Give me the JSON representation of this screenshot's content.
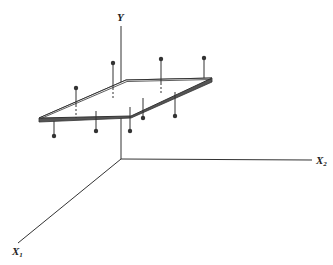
{
  "figure": {
    "axes": {
      "y_label": "Y",
      "x1_label": "X",
      "x1_subscript": "1",
      "x2_label": "X",
      "x2_subscript": "2"
    },
    "colors": {
      "ink": "#3a3a3a",
      "plane_fill": "#ffffff"
    },
    "points": [
      {
        "id": "p1",
        "side": "above"
      },
      {
        "id": "p2",
        "side": "above"
      },
      {
        "id": "p3",
        "side": "above"
      },
      {
        "id": "p4",
        "side": "above"
      },
      {
        "id": "p5",
        "side": "below"
      },
      {
        "id": "p6",
        "side": "below"
      },
      {
        "id": "p7",
        "side": "below"
      },
      {
        "id": "p8",
        "side": "below"
      },
      {
        "id": "p9",
        "side": "below"
      }
    ]
  }
}
